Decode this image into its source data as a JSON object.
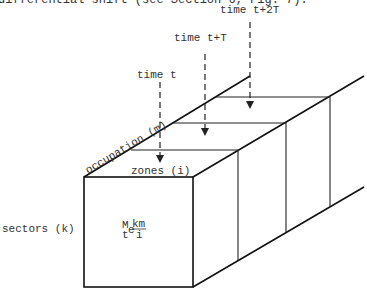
{
  "caption": "differential shift (see Section 6, Fig. 7).",
  "time_labels": [
    "time t",
    "time t+T",
    "time t+2T"
  ],
  "axes": {
    "occupation": "occupation (m)",
    "zones": "zones (i)",
    "sectors": "sectors (k)"
  },
  "cell_formula": {
    "main": "M",
    "sup": "km",
    "pre_sub": "t",
    "e": "e",
    "e_sub": "i"
  }
}
